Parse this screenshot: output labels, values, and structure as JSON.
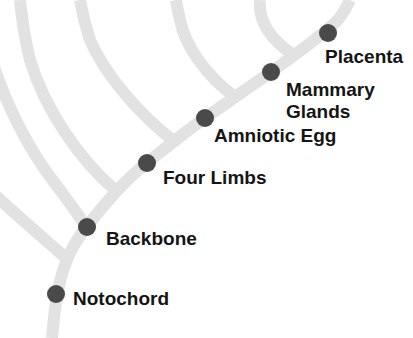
{
  "diagram": {
    "type": "cladogram",
    "colors": {
      "branch": "#e2e2e2",
      "node": "#4a4a4a",
      "text": "#151515",
      "background": "#ffffff"
    },
    "traits": [
      {
        "id": "notochord",
        "label": "Notochord"
      },
      {
        "id": "backbone",
        "label": "Backbone"
      },
      {
        "id": "four-limbs",
        "label": "Four Limbs"
      },
      {
        "id": "amniotic-egg",
        "label": "Amniotic Egg"
      },
      {
        "id": "mammary-glands",
        "label_line1": "Mammary",
        "label_line2": "Glands"
      },
      {
        "id": "placenta",
        "label": "Placenta"
      }
    ]
  }
}
